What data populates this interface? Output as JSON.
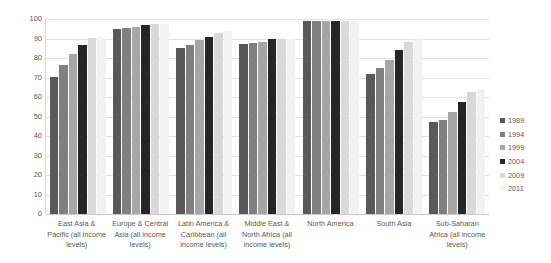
{
  "chart_data": {
    "type": "bar",
    "title": "",
    "subtitle": "",
    "xlabel": "",
    "ylabel": "",
    "ylim": [
      0,
      100
    ],
    "ytick_step": 10,
    "yticks": [
      "100",
      "90",
      "80",
      "70",
      "60",
      "50",
      "40",
      "30",
      "20",
      "10",
      "0"
    ],
    "grid": true,
    "legend_position": "right",
    "categories": [
      "East Asia & Pacific (all income levels)",
      "Europe & Central Asia (all income levels)",
      "Latin America & Caribbean (all income levels)",
      "Middle East & North Africa (all income levels)",
      "North America",
      "South Asia",
      "Sub-Saharan Africa (all income levels)"
    ],
    "series": [
      {
        "name": "1989",
        "color": "#595959",
        "values": [
          70.5,
          95,
          85,
          87,
          99,
          72,
          47
        ]
      },
      {
        "name": "1994",
        "color": "#808080",
        "values": [
          76.5,
          95.5,
          86.5,
          87.5,
          99,
          75,
          48
        ]
      },
      {
        "name": "1999",
        "color": "#a6a6a6",
        "values": [
          82,
          96,
          89,
          88,
          99,
          79,
          52.5
        ]
      },
      {
        "name": "2004",
        "color": "#262626",
        "values": [
          86.5,
          97,
          91,
          89.5,
          99,
          84,
          57.5
        ]
      },
      {
        "name": "2009",
        "color": "#d9d9d9",
        "values": [
          90.5,
          97.5,
          93,
          90,
          99,
          88,
          62.5
        ]
      },
      {
        "name": "2011",
        "color": "#f2f2f2",
        "values": [
          91,
          97.5,
          94,
          90,
          99,
          90.5,
          64
        ]
      }
    ]
  },
  "legend": {
    "items": [
      {
        "label": "1989",
        "color": "#595959"
      },
      {
        "label": "1994",
        "color": "#808080"
      },
      {
        "label": "1999",
        "color": "#a6a6a6"
      },
      {
        "label": "2004",
        "color": "#262626"
      },
      {
        "label": "2009",
        "color": "#d9d9d9"
      },
      {
        "label": "2011",
        "color": "#f2f2f2"
      }
    ]
  }
}
